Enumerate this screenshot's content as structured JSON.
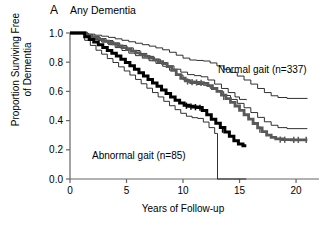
{
  "panel": {
    "letter": "A",
    "title": "Any Dementia"
  },
  "axes": {
    "ylabel_line1": "Proportion Surviving Free",
    "ylabel_line2": "of Dementia",
    "xlabel": "Years of Follow-up",
    "yticks": [
      "1.0",
      "0.8",
      "0.6",
      "0.4",
      "0.2",
      "0.0"
    ],
    "ytick_values": [
      1.0,
      0.8,
      0.6,
      0.4,
      0.2,
      0.0
    ],
    "xticks": [
      "0",
      "5",
      "10",
      "15",
      "20"
    ],
    "xtick_values": [
      0,
      5,
      10,
      15,
      20
    ]
  },
  "annotations": {
    "normal_label": "Normal gait (n=337)",
    "abnormal_label": "Abnormal gait (n=85)"
  },
  "colors": {
    "normal_curve": "#595959",
    "abnormal_curve": "#000000",
    "ci_band": "#1a1a1a",
    "axis": "#666666",
    "background": "#ffffff"
  },
  "chart_data": {
    "type": "line",
    "subtype": "kaplan-meier-survival",
    "title": "Any Dementia",
    "xlabel": "Years of Follow-up",
    "ylabel": "Proportion Surviving Free of Dementia",
    "xlim": [
      0,
      21.5
    ],
    "ylim": [
      0.0,
      1.0
    ],
    "grid": false,
    "legend_position": "inline-annotation",
    "series": [
      {
        "name": "Normal gait (n=337)",
        "kind": "estimate",
        "style": "thick-gray",
        "color": "#595959",
        "points": [
          [
            0.0,
            1.0
          ],
          [
            1.2,
            1.0
          ],
          [
            1.4,
            0.985
          ],
          [
            1.8,
            0.975
          ],
          [
            2.2,
            0.965
          ],
          [
            2.6,
            0.955
          ],
          [
            3.0,
            0.945
          ],
          [
            3.4,
            0.935
          ],
          [
            3.8,
            0.925
          ],
          [
            4.2,
            0.912
          ],
          [
            4.6,
            0.9
          ],
          [
            5.0,
            0.888
          ],
          [
            5.4,
            0.876
          ],
          [
            5.8,
            0.864
          ],
          [
            6.2,
            0.852
          ],
          [
            6.6,
            0.84
          ],
          [
            7.0,
            0.828
          ],
          [
            7.4,
            0.816
          ],
          [
            7.8,
            0.804
          ],
          [
            8.2,
            0.79
          ],
          [
            8.6,
            0.77
          ],
          [
            9.0,
            0.745
          ],
          [
            9.4,
            0.715
          ],
          [
            9.8,
            0.69
          ],
          [
            10.2,
            0.672
          ],
          [
            10.6,
            0.665
          ],
          [
            11.0,
            0.662
          ],
          [
            11.4,
            0.66
          ],
          [
            11.8,
            0.655
          ],
          [
            12.2,
            0.64
          ],
          [
            12.6,
            0.62
          ],
          [
            13.0,
            0.6
          ],
          [
            13.4,
            0.575
          ],
          [
            13.8,
            0.55
          ],
          [
            14.2,
            0.525
          ],
          [
            14.6,
            0.5
          ],
          [
            15.0,
            0.47
          ],
          [
            15.4,
            0.44
          ],
          [
            15.8,
            0.41
          ],
          [
            16.2,
            0.38
          ],
          [
            16.6,
            0.35
          ],
          [
            17.0,
            0.325
          ],
          [
            17.4,
            0.3
          ],
          [
            17.8,
            0.285
          ],
          [
            18.2,
            0.275
          ],
          [
            18.8,
            0.27
          ],
          [
            19.6,
            0.268
          ],
          [
            21.0,
            0.268
          ]
        ],
        "censor_marks": [
          [
            10.4,
            0.668
          ],
          [
            10.8,
            0.664
          ],
          [
            11.2,
            0.661
          ],
          [
            11.6,
            0.658
          ],
          [
            13.6,
            0.562
          ],
          [
            16.8,
            0.338
          ],
          [
            18.6,
            0.27
          ],
          [
            19.0,
            0.269
          ],
          [
            19.8,
            0.268
          ],
          [
            20.2,
            0.268
          ],
          [
            20.9,
            0.268
          ]
        ],
        "endpoint_value": 0.27
      },
      {
        "name": "Normal gait upper 95% CI",
        "kind": "confidence-upper",
        "style": "thin",
        "color": "#1a1a1a",
        "points": [
          [
            0.0,
            1.0
          ],
          [
            1.2,
            1.0
          ],
          [
            1.6,
            0.992
          ],
          [
            2.2,
            0.985
          ],
          [
            2.8,
            0.978
          ],
          [
            3.4,
            0.97
          ],
          [
            4.0,
            0.96
          ],
          [
            4.6,
            0.95
          ],
          [
            5.2,
            0.94
          ],
          [
            5.8,
            0.93
          ],
          [
            6.4,
            0.92
          ],
          [
            7.0,
            0.91
          ],
          [
            7.6,
            0.898
          ],
          [
            8.2,
            0.885
          ],
          [
            8.8,
            0.868
          ],
          [
            9.4,
            0.848
          ],
          [
            10.0,
            0.828
          ],
          [
            10.6,
            0.815
          ],
          [
            11.2,
            0.812
          ],
          [
            11.8,
            0.808
          ],
          [
            12.4,
            0.795
          ],
          [
            13.0,
            0.775
          ],
          [
            13.6,
            0.752
          ],
          [
            14.2,
            0.73
          ],
          [
            14.8,
            0.705
          ],
          [
            15.4,
            0.678
          ],
          [
            16.0,
            0.65
          ],
          [
            16.6,
            0.62
          ],
          [
            17.2,
            0.592
          ],
          [
            17.8,
            0.57
          ],
          [
            18.4,
            0.558
          ],
          [
            19.2,
            0.552
          ],
          [
            21.0,
            0.55
          ]
        ],
        "endpoint_value": 0.45
      },
      {
        "name": "Normal gait lower 95% CI",
        "kind": "confidence-lower",
        "style": "thin",
        "color": "#1a1a1a",
        "points": [
          [
            0.0,
            1.0
          ],
          [
            1.2,
            1.0
          ],
          [
            1.6,
            0.975
          ],
          [
            2.2,
            0.955
          ],
          [
            2.8,
            0.938
          ],
          [
            3.4,
            0.92
          ],
          [
            4.0,
            0.9
          ],
          [
            4.6,
            0.88
          ],
          [
            5.2,
            0.862
          ],
          [
            5.8,
            0.845
          ],
          [
            6.4,
            0.828
          ],
          [
            7.0,
            0.81
          ],
          [
            7.6,
            0.792
          ],
          [
            8.2,
            0.772
          ],
          [
            8.8,
            0.745
          ],
          [
            9.4,
            0.712
          ],
          [
            10.0,
            0.68
          ],
          [
            10.6,
            0.655
          ],
          [
            11.2,
            0.648
          ],
          [
            11.8,
            0.642
          ],
          [
            12.4,
            0.622
          ],
          [
            13.0,
            0.598
          ],
          [
            13.6,
            0.572
          ],
          [
            14.2,
            0.545
          ],
          [
            14.8,
            0.518
          ],
          [
            15.4,
            0.488
          ],
          [
            16.0,
            0.455
          ],
          [
            16.6,
            0.422
          ],
          [
            17.2,
            0.392
          ],
          [
            17.8,
            0.368
          ],
          [
            18.4,
            0.352
          ],
          [
            19.2,
            0.345
          ],
          [
            21.0,
            0.345
          ]
        ],
        "endpoint_value": 0.16
      },
      {
        "name": "Abnormal gait (n=85)",
        "kind": "estimate",
        "style": "thick-black",
        "color": "#000000",
        "points": [
          [
            0.0,
            1.0
          ],
          [
            1.0,
            1.0
          ],
          [
            1.3,
            0.975
          ],
          [
            1.7,
            0.955
          ],
          [
            2.1,
            0.938
          ],
          [
            2.5,
            0.92
          ],
          [
            2.9,
            0.9
          ],
          [
            3.3,
            0.88
          ],
          [
            3.7,
            0.862
          ],
          [
            4.1,
            0.842
          ],
          [
            4.5,
            0.82
          ],
          [
            4.9,
            0.798
          ],
          [
            5.3,
            0.775
          ],
          [
            5.7,
            0.752
          ],
          [
            6.1,
            0.728
          ],
          [
            6.5,
            0.705
          ],
          [
            6.9,
            0.682
          ],
          [
            7.3,
            0.658
          ],
          [
            7.7,
            0.635
          ],
          [
            8.1,
            0.61
          ],
          [
            8.5,
            0.586
          ],
          [
            8.9,
            0.562
          ],
          [
            9.3,
            0.54
          ],
          [
            9.7,
            0.52
          ],
          [
            10.1,
            0.505
          ],
          [
            10.5,
            0.498
          ],
          [
            10.9,
            0.494
          ],
          [
            11.3,
            0.49
          ],
          [
            11.7,
            0.47
          ],
          [
            12.1,
            0.44
          ],
          [
            12.5,
            0.41
          ],
          [
            12.9,
            0.382
          ],
          [
            13.3,
            0.352
          ],
          [
            13.7,
            0.322
          ],
          [
            14.1,
            0.292
          ],
          [
            14.5,
            0.262
          ],
          [
            14.9,
            0.24
          ],
          [
            15.3,
            0.228
          ],
          [
            15.6,
            0.228
          ]
        ],
        "censor_marks": [
          [
            10.3,
            0.502
          ],
          [
            10.7,
            0.496
          ],
          [
            11.1,
            0.492
          ],
          [
            11.5,
            0.488
          ],
          [
            13.5,
            0.338
          ]
        ],
        "endpoint_value": 0.09
      },
      {
        "name": "Abnormal gait upper 95% CI",
        "kind": "confidence-upper",
        "style": "thin",
        "color": "#1a1a1a",
        "points": [
          [
            0.0,
            1.0
          ],
          [
            1.0,
            1.0
          ],
          [
            1.4,
            0.988
          ],
          [
            2.0,
            0.975
          ],
          [
            2.6,
            0.962
          ],
          [
            3.2,
            0.948
          ],
          [
            3.8,
            0.932
          ],
          [
            4.4,
            0.915
          ],
          [
            5.0,
            0.898
          ],
          [
            5.6,
            0.88
          ],
          [
            6.2,
            0.86
          ],
          [
            6.8,
            0.84
          ],
          [
            7.4,
            0.82
          ],
          [
            8.0,
            0.798
          ],
          [
            8.6,
            0.775
          ],
          [
            9.2,
            0.752
          ],
          [
            9.8,
            0.732
          ],
          [
            10.4,
            0.715
          ],
          [
            11.0,
            0.708
          ],
          [
            11.6,
            0.7
          ],
          [
            12.2,
            0.678
          ],
          [
            12.8,
            0.65
          ],
          [
            13.4,
            0.62
          ],
          [
            14.0,
            0.592
          ],
          [
            14.6,
            0.562
          ],
          [
            15.0,
            0.545
          ],
          [
            15.6,
            0.54
          ]
        ],
        "endpoint_value": 0.22
      },
      {
        "name": "Abnormal gait lower 95% CI",
        "kind": "confidence-lower",
        "style": "thin",
        "color": "#1a1a1a",
        "points": [
          [
            0.0,
            1.0
          ],
          [
            0.9,
            1.0
          ],
          [
            1.3,
            0.95
          ],
          [
            1.8,
            0.915
          ],
          [
            2.3,
            0.882
          ],
          [
            2.8,
            0.855
          ],
          [
            3.3,
            0.825
          ],
          [
            3.8,
            0.798
          ],
          [
            4.3,
            0.768
          ],
          [
            4.8,
            0.74
          ],
          [
            5.3,
            0.712
          ],
          [
            5.8,
            0.682
          ],
          [
            6.3,
            0.652
          ],
          [
            6.8,
            0.622
          ],
          [
            7.3,
            0.592
          ],
          [
            7.8,
            0.562
          ],
          [
            8.3,
            0.532
          ],
          [
            8.8,
            0.502
          ],
          [
            9.3,
            0.475
          ],
          [
            9.8,
            0.45
          ],
          [
            10.3,
            0.43
          ],
          [
            10.8,
            0.42
          ],
          [
            11.3,
            0.415
          ],
          [
            11.8,
            0.39
          ],
          [
            12.3,
            0.352
          ],
          [
            12.8,
            0.312
          ],
          [
            13.0,
            0.312
          ],
          [
            13.05,
            0.0
          ],
          [
            15.6,
            0.0
          ]
        ],
        "endpoint_value": 0.0
      }
    ]
  }
}
